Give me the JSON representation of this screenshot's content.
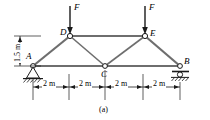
{
  "figure": {
    "caption": "(a)",
    "colors": {
      "member": "#6e6e6e",
      "line": "#1a1a1a",
      "joint_fill": "#ffffff",
      "background": "#ffffff"
    },
    "joints": [
      {
        "id": "A",
        "label": "A",
        "x": 33,
        "y": 66,
        "support": "pin"
      },
      {
        "id": "B",
        "label": "B",
        "x": 180,
        "y": 66,
        "support": "roller"
      },
      {
        "id": "C",
        "label": "C",
        "x": 105,
        "y": 66,
        "support": "none"
      },
      {
        "id": "D",
        "label": "D",
        "x": 70,
        "y": 36,
        "support": "none"
      },
      {
        "id": "E",
        "label": "E",
        "x": 145,
        "y": 36,
        "support": "none"
      }
    ],
    "members": [
      {
        "from": "A",
        "to": "D"
      },
      {
        "from": "D",
        "to": "E"
      },
      {
        "from": "E",
        "to": "B"
      },
      {
        "from": "A",
        "to": "C"
      },
      {
        "from": "C",
        "to": "B"
      },
      {
        "from": "D",
        "to": "C"
      },
      {
        "from": "C",
        "to": "E"
      }
    ],
    "loads": [
      {
        "id": "load-D",
        "label": "F",
        "at_joint": "D",
        "direction": "down",
        "x": 70,
        "tail_y": 6,
        "head_y": 34
      },
      {
        "id": "load-E",
        "label": "F",
        "at_joint": "E",
        "direction": "down",
        "x": 145,
        "tail_y": 6,
        "head_y": 34
      }
    ],
    "horizontal_dimensions": {
      "segments": [
        {
          "label": "2 m",
          "from_x": 33,
          "to_x": 69
        },
        {
          "label": "2 m",
          "from_x": 69,
          "to_x": 105
        },
        {
          "label": "2 m",
          "from_x": 105,
          "to_x": 143
        },
        {
          "label": "2 m",
          "from_x": 143,
          "to_x": 180
        }
      ],
      "line_y": 87
    },
    "vertical_dimension": {
      "label": "1.5 m",
      "x": 20,
      "top_y": 36,
      "bottom_y": 66
    }
  }
}
